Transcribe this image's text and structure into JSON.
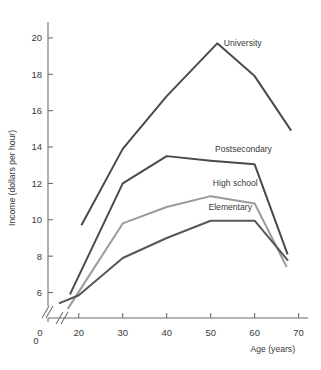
{
  "chart_data": {
    "type": "line",
    "title": "",
    "xlabel": "Age (years)",
    "ylabel": "Income (dollars per hour)",
    "xlim": [
      13,
      71
    ],
    "ylim": [
      4.6,
      20.6
    ],
    "xticks": [
      0,
      20,
      30,
      40,
      50,
      60,
      70
    ],
    "yticks": [
      0,
      6,
      8,
      10,
      12,
      14,
      16,
      18,
      20
    ],
    "xtick_labels": [
      "0",
      "20",
      "30",
      "40",
      "50",
      "60",
      "70"
    ],
    "ytick_labels": [
      "0",
      "6",
      "8",
      "10",
      "12",
      "14",
      "16",
      "18",
      "20"
    ],
    "grid": false,
    "legend_position": "inline-annotations",
    "axis_break_x": true,
    "axis_break_y": true,
    "series": [
      {
        "name": "University",
        "color": "#4a4a4a",
        "width": 2.0,
        "x": [
          20.6,
          30,
          40,
          51.5,
          60,
          68.3
        ],
        "values": [
          9.7,
          13.9,
          16.8,
          19.7,
          17.9,
          14.9
        ]
      },
      {
        "name": "Postsecondary",
        "color": "#4a4a4a",
        "width": 2.0,
        "x": [
          18,
          30,
          40,
          50,
          60,
          67.5
        ],
        "values": [
          5.9,
          12.0,
          13.5,
          13.25,
          13.05,
          8.1
        ]
      },
      {
        "name": "High school",
        "color": "#9a9a9a",
        "width": 2.0,
        "x": [
          17.5,
          30,
          40,
          50,
          60,
          67.3
        ],
        "values": [
          5.1,
          9.8,
          10.7,
          11.3,
          10.9,
          7.4
        ]
      },
      {
        "name": "Elementary",
        "color": "#575757",
        "width": 2.0,
        "x": [
          15.5,
          20,
          30,
          40,
          50,
          60,
          67.6
        ],
        "values": [
          5.4,
          5.85,
          7.9,
          9.0,
          9.95,
          9.95,
          7.75
        ]
      }
    ],
    "annotations": [
      {
        "text": "University",
        "x": 53.0,
        "y": 19.55
      },
      {
        "text": "Postsecondary",
        "x": 51.0,
        "y": 13.75
      },
      {
        "text": "High school",
        "x": 50.5,
        "y": 11.85
      },
      {
        "text": "Elementary",
        "x": 49.5,
        "y": 10.55
      }
    ]
  }
}
